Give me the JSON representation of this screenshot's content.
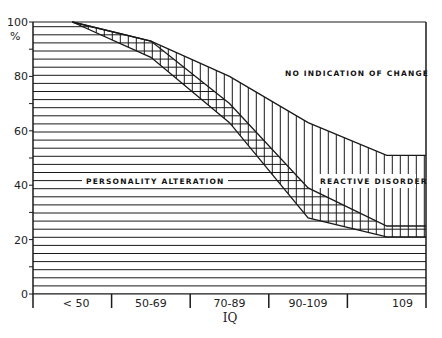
{
  "chart_data": {
    "type": "area",
    "title": "",
    "xlabel": "IQ",
    "ylabel": "%",
    "ylim": [
      0,
      100
    ],
    "yticks": [
      0,
      20,
      40,
      60,
      80,
      100
    ],
    "categories": [
      "< 50",
      "50-69",
      "70-89",
      "90-109",
      "109"
    ],
    "x_positions": [
      0.5,
      1.5,
      2.5,
      3.5,
      4.5,
      5.0
    ],
    "boundaries": [
      {
        "name": "upper boundary of reactive disorder",
        "values": [
          100,
          93,
          80,
          63,
          51,
          51
        ]
      },
      {
        "name": "upper boundary of personality alteration",
        "values": [
          100,
          93,
          70,
          39,
          25,
          25
        ]
      },
      {
        "name": "lower boundary of reactive disorder",
        "values": [
          100,
          87,
          63,
          28,
          21,
          21
        ]
      }
    ],
    "regions": [
      {
        "name": "NO INDICATION OF CHANGE",
        "pattern": "blank",
        "from": "upper boundary of reactive disorder",
        "to": 100
      },
      {
        "name": "REACTIVE DISORDER",
        "pattern": "vertical hatch",
        "from": "lower boundary of reactive disorder",
        "to": "upper boundary of reactive disorder"
      },
      {
        "name": "PERSONALITY ALTERATION",
        "pattern": "horizontal hatch",
        "from": 0,
        "to": "upper boundary of personality alteration"
      }
    ],
    "grid": false,
    "legend": "inline labels"
  },
  "labels": {
    "y_unit": "%",
    "x_title": "IQ",
    "no_change": "NO INDICATION OF CHANGE",
    "reactive": "REACTIVE DISORDER",
    "personality": "PERSONALITY ALTERATION"
  },
  "style": {
    "ink": "#1a1a1a",
    "background": "#ffffff"
  }
}
